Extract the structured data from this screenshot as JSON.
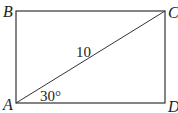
{
  "diagram": {
    "type": "rectangle-with-diagonal",
    "vertices": {
      "A": {
        "label": "A"
      },
      "B": {
        "label": "B"
      },
      "C": {
        "label": "C"
      },
      "D": {
        "label": "D"
      }
    },
    "diagonal": {
      "from": "A",
      "to": "C",
      "length_label": "10"
    },
    "angle": {
      "at": "A",
      "label": "30°"
    },
    "colors": {
      "stroke": "#333333",
      "text": "#222222",
      "background": "#ffffff"
    }
  }
}
